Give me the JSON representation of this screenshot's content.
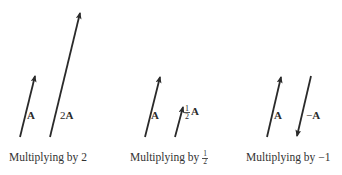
{
  "figure": {
    "panels": [
      {
        "caption": "Multiplying by 2",
        "vectors": [
          {
            "label": "A",
            "from": [
              20,
              137
            ],
            "to": [
              35,
              75
            ]
          },
          {
            "label": "2A",
            "coef": "2",
            "base": "A",
            "from": [
              50,
              137
            ],
            "to": [
              80,
              12
            ]
          }
        ]
      },
      {
        "caption_prefix": "Multiplying by",
        "caption_frac": {
          "num": "1",
          "den": "2"
        },
        "vectors": [
          {
            "label": "A",
            "from": [
              145,
              137
            ],
            "to": [
              160,
              76
            ]
          },
          {
            "label": "½A",
            "base": "A",
            "frac": {
              "num": "1",
              "den": "2"
            },
            "from": [
              175,
              137
            ],
            "to": [
              183,
              106
            ]
          }
        ]
      },
      {
        "caption": "Multiplying by −1",
        "vectors": [
          {
            "label": "A",
            "from": [
              267,
              137
            ],
            "to": [
              281,
              76
            ]
          },
          {
            "label": "−A",
            "sign": "−",
            "base": "A",
            "from": [
              311,
              76
            ],
            "to": [
              297,
              137
            ]
          }
        ]
      }
    ],
    "colors": {
      "ink": "#2a2a2a",
      "background": "#ffffff"
    }
  }
}
